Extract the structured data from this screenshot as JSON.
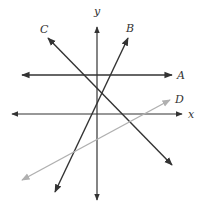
{
  "diagram": {
    "title": "",
    "axes": {
      "x": {
        "label": "x",
        "from": [
          12,
          114
        ],
        "to": [
          182,
          114
        ],
        "label_pos": [
          188,
          118
        ]
      },
      "y": {
        "label": "y",
        "from": [
          97,
          200
        ],
        "to": [
          97,
          27
        ],
        "label_pos": [
          94,
          15
        ]
      }
    },
    "lines": [
      {
        "id": "A",
        "label": "A",
        "from": [
          22,
          75
        ],
        "to": [
          172,
          75
        ],
        "label_pos": [
          177,
          79
        ],
        "color": "#333333",
        "bidirectional": true
      },
      {
        "id": "B",
        "label": "B",
        "from": [
          55,
          192
        ],
        "to": [
          128,
          38
        ],
        "label_pos": [
          126,
          32
        ],
        "color": "#333333",
        "bidirectional": true
      },
      {
        "id": "C",
        "label": "C",
        "from": [
          48,
          38
        ],
        "to": [
          172,
          165
        ],
        "label_pos": [
          40,
          33
        ],
        "color": "#333333",
        "bidirectional": true
      },
      {
        "id": "D",
        "label": "D",
        "from": [
          22,
          180
        ],
        "to": [
          170,
          100
        ],
        "label_pos": [
          175,
          103
        ],
        "color": "#b0b0b0",
        "bidirectional": true
      }
    ],
    "axis_color": "#333333"
  }
}
